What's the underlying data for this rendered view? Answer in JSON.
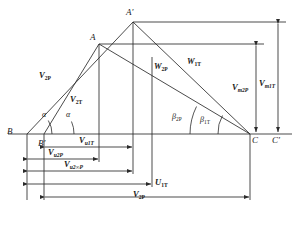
{
  "diagram": {
    "stroke_color": "#2b2b2b",
    "text_color": "#1a1a1a",
    "background": "#ffffff",
    "points": [
      {
        "id": "A_prime",
        "label": "A",
        "prime": "′",
        "x": 133,
        "y": 22
      },
      {
        "id": "A",
        "label": "A",
        "prime": "",
        "x": 99,
        "y": 44
      },
      {
        "id": "B",
        "label": "B",
        "prime": "",
        "x": 27,
        "y": 134
      },
      {
        "id": "B_prime",
        "label": "B",
        "prime": "′",
        "x": 44,
        "y": 134
      },
      {
        "id": "C",
        "label": "C",
        "prime": "",
        "x": 250,
        "y": 134
      },
      {
        "id": "C_prime",
        "label": "C",
        "prime": "′",
        "x": 278,
        "y": 134
      }
    ],
    "vectors": [
      {
        "id": "V2P_left",
        "base": "V",
        "sub": "2P",
        "x": 45,
        "y": 76
      },
      {
        "id": "V2T_left",
        "base": "V",
        "sub": "2T",
        "x": 75,
        "y": 100
      },
      {
        "id": "W2P",
        "base": "W",
        "sub": "2P",
        "x": 160,
        "y": 68
      },
      {
        "id": "W1T",
        "base": "W",
        "sub": "1T",
        "x": 193,
        "y": 63
      },
      {
        "id": "Vm2P",
        "base": "V",
        "sub": "m2P",
        "x": 240,
        "y": 88
      },
      {
        "id": "Vm1T",
        "base": "V",
        "sub": "m1T",
        "x": 267,
        "y": 84
      }
    ],
    "angles": [
      {
        "id": "alpha_outer",
        "glyph": "α",
        "sub": "",
        "x": 44,
        "y": 116
      },
      {
        "id": "alpha_inner",
        "glyph": "α",
        "sub": "",
        "x": 67,
        "y": 116
      },
      {
        "id": "beta_2P",
        "glyph": "β",
        "sub": "2P",
        "x": 177,
        "y": 118
      },
      {
        "id": "beta_1T",
        "glyph": "β",
        "sub": "1T",
        "x": 205,
        "y": 121
      }
    ],
    "dimensions": [
      {
        "id": "Vu1T",
        "base": "V",
        "sub": "u1T",
        "label_x": 90,
        "label_y": 140,
        "row_y": 147,
        "x1": 44,
        "x2": 133
      },
      {
        "id": "Vu2P",
        "base": "V",
        "sub": "u2P",
        "label_x": 53,
        "label_y": 152,
        "row_y": 159,
        "x1": 27,
        "x2": 99
      },
      {
        "id": "Vu2infP",
        "base": "V",
        "sub": "u2∞P",
        "label_x": 72,
        "label_y": 164,
        "row_y": 171,
        "x1": 27,
        "x2": 133
      },
      {
        "id": "U1T",
        "base": "U",
        "sub": "1T",
        "label_x": 158,
        "label_y": 179,
        "row_y": 184,
        "x1": 27,
        "x2": 152
      },
      {
        "id": "V2P_bot",
        "base": "V",
        "sub": "2P",
        "label_x": 139,
        "label_y": 193,
        "row_y": 197,
        "x1": 44,
        "x2": 250
      }
    ],
    "callout_lines": [
      {
        "id": "baseline",
        "x1": 8,
        "y1": 134,
        "x2": 292,
        "y2": 134
      },
      {
        "id": "top-line-A-prime",
        "x1": 133,
        "y1": 22,
        "x2": 286,
        "y2": 22
      },
      {
        "id": "top-line-A",
        "x1": 99,
        "y1": 44,
        "x2": 262,
        "y2": 44
      }
    ],
    "vertical_arrows": [
      {
        "id": "Vm2P-arrow",
        "x": 256,
        "y_top": 44,
        "y_bot": 134
      },
      {
        "id": "Vm1T-arrow",
        "x": 278,
        "y_top": 22,
        "y_bot": 134
      }
    ]
  }
}
